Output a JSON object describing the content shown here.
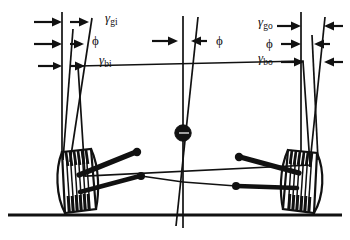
{
  "figure": {
    "ground_label": "ground line",
    "stroke_color": "#111111",
    "background_color": "#ffffff"
  },
  "labels": {
    "gamma_gi": {
      "symbol": "γ",
      "subscript": "gi",
      "meaning": "camber angle, ground, inner wheel"
    },
    "phi_left": {
      "symbol": "ϕ",
      "meaning": "kingpin inclination, inner wheel"
    },
    "gamma_bi": {
      "symbol": "γ",
      "subscript": "bi",
      "meaning": "camber angle, body, inner wheel"
    },
    "phi_center": {
      "symbol": "ϕ",
      "meaning": "body roll angle at vehicle centreline"
    },
    "gamma_go": {
      "symbol": "γ",
      "subscript": "go",
      "meaning": "camber angle, ground, outer wheel"
    },
    "phi_right": {
      "symbol": "ϕ",
      "meaning": "kingpin inclination, outer wheel"
    },
    "gamma_bo": {
      "symbol": "γ",
      "subscript": "bo",
      "meaning": "camber angle, body, outer wheel"
    }
  },
  "elements": {
    "ground_line": "horizontal road surface reference",
    "vehicle_centreline": "vertical centreline",
    "body_centreline": "tilted body centreline",
    "body_outline": "rolled vehicle body quadrilateral",
    "hub": "roll centre marker",
    "left_wheel": "inner wheel, tilted",
    "right_wheel": "outer wheel, tilted",
    "left_upper_arm": "inner upper control arm",
    "left_lower_arm": "inner lower control arm",
    "right_upper_arm": "outer upper control arm",
    "right_lower_arm": "outer lower control arm"
  }
}
